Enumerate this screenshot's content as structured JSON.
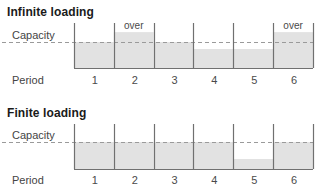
{
  "panels": [
    {
      "title": "Infinite loading",
      "capacity_label": "Capacity",
      "period_label": "Period"
    },
    {
      "title": "Finite loading",
      "capacity_label": "Capacity",
      "period_label": "Period"
    }
  ],
  "colors": {
    "bar_fill": "#e2e2e2",
    "divider_line": "#707070",
    "capacity_line": "#9a9a9a",
    "label_text": "#4a4a4a",
    "title_text": "#1a1a1a"
  },
  "chart_data": [
    {
      "type": "bar",
      "title": "Infinite loading",
      "xlabel": "Period",
      "ylabel": "Capacity",
      "categories": [
        "1",
        "2",
        "3",
        "4",
        "5",
        "6"
      ],
      "values": [
        100,
        138,
        100,
        73,
        73,
        138
      ],
      "value_unit": "% of capacity (estimated)",
      "capacity": 100,
      "capacity_line_style": "dashed",
      "annotations": [
        {
          "category": "2",
          "text": "over"
        },
        {
          "category": "6",
          "text": "over"
        }
      ],
      "grid": false,
      "legend": "none"
    },
    {
      "type": "bar",
      "title": "Finite loading",
      "xlabel": "Period",
      "ylabel": "Capacity",
      "categories": [
        "1",
        "2",
        "3",
        "4",
        "5",
        "6"
      ],
      "values": [
        100,
        100,
        100,
        100,
        37,
        100
      ],
      "value_unit": "% of capacity (estimated)",
      "capacity": 100,
      "capacity_line_style": "dashed",
      "annotations": [],
      "grid": false,
      "legend": "none"
    }
  ]
}
